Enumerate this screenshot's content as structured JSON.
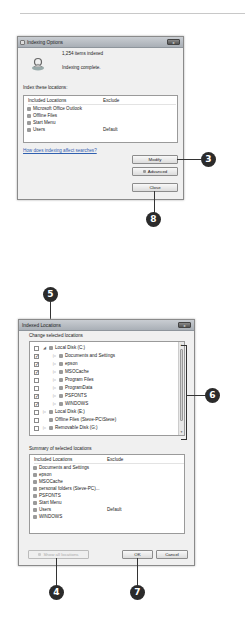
{
  "indexing_options": {
    "title": "Indexing Options",
    "items_indexed": "1,254 items indexed",
    "status": "Indexing complete.",
    "index_label": "Index these locations:",
    "columns": {
      "included": "Included Locations",
      "exclude": "Exclude"
    },
    "locations": [
      {
        "name": "Microsoft Office Outlook",
        "exclude": ""
      },
      {
        "name": "Offline Files",
        "exclude": ""
      },
      {
        "name": "Start Menu",
        "exclude": ""
      },
      {
        "name": "Users",
        "exclude": "Default"
      }
    ],
    "help_link": "How does indexing affect searches?",
    "buttons": {
      "modify": "Modify",
      "advanced": "Advanced",
      "close": "Close"
    },
    "close_glyph": "x"
  },
  "indexed_locations": {
    "title": "Indexed Locations",
    "change_label": "Change selected locations",
    "tree": [
      {
        "name": "Local Disk (C:)",
        "checked": false,
        "level": 0,
        "expander": "◢"
      },
      {
        "name": "Documents and Settings",
        "checked": true,
        "level": 1,
        "expander": "▷"
      },
      {
        "name": "epson",
        "checked": true,
        "level": 1,
        "expander": "▷"
      },
      {
        "name": "MSOCache",
        "checked": true,
        "level": 1,
        "expander": "▷"
      },
      {
        "name": "Program Files",
        "checked": false,
        "level": 1,
        "expander": "▷"
      },
      {
        "name": "ProgramData",
        "checked": false,
        "level": 1,
        "expander": "▷"
      },
      {
        "name": "PSFONTS",
        "checked": true,
        "level": 1,
        "expander": "▷"
      },
      {
        "name": "WINDOWS",
        "checked": true,
        "level": 1,
        "expander": "▷"
      },
      {
        "name": "Local Disk (E:)",
        "checked": false,
        "level": 0,
        "expander": "▷"
      },
      {
        "name": "Offline Files (Steve-PC\\Steve)",
        "checked": false,
        "level": 0,
        "expander": ""
      },
      {
        "name": "Removable Disk (G:)",
        "checked": false,
        "level": 0,
        "expander": "▷"
      }
    ],
    "summary_label": "Summary of selected locations",
    "columns": {
      "included": "Included Locations",
      "exclude": "Exclude"
    },
    "summary": [
      {
        "name": "Documents and Settings",
        "exclude": ""
      },
      {
        "name": "epson",
        "exclude": ""
      },
      {
        "name": "MSOCache",
        "exclude": ""
      },
      {
        "name": "personal folders (Steve-PC)...",
        "exclude": ""
      },
      {
        "name": "PSFONTS",
        "exclude": ""
      },
      {
        "name": "Start Menu",
        "exclude": ""
      },
      {
        "name": "Users",
        "exclude": "Default"
      },
      {
        "name": "WINDOWS",
        "exclude": ""
      }
    ],
    "buttons": {
      "show_all": "Show all locations",
      "ok": "OK",
      "cancel": "Cancel"
    },
    "close_glyph": "x"
  },
  "callouts": {
    "c3": "3",
    "c8": "8",
    "c5": "5",
    "c6": "6",
    "c4": "4",
    "c7": "7"
  },
  "check_glyph": "✓",
  "colors": {
    "callout": "#2b2b2b",
    "link": "#3060b0",
    "dialog_bg": "#f0f0f0"
  }
}
